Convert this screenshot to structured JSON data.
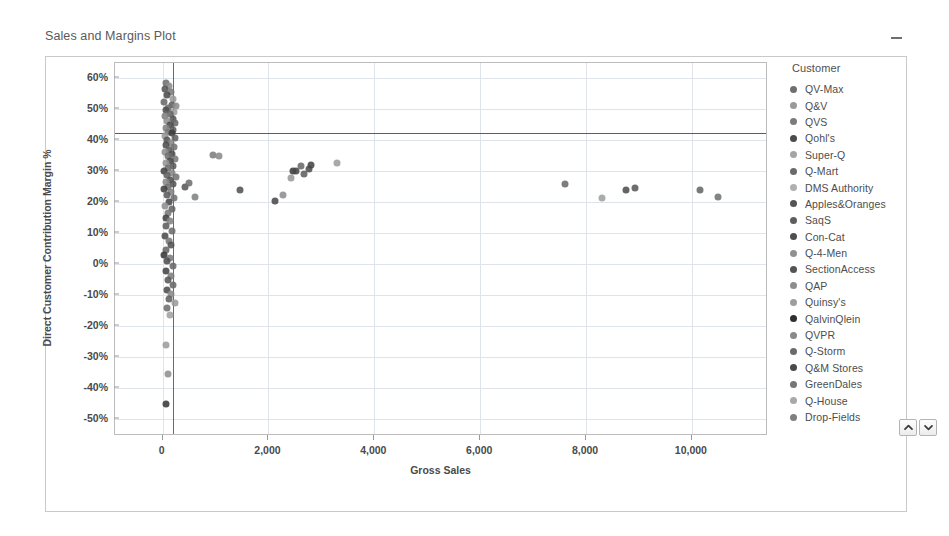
{
  "title": "Sales and Margins Plot",
  "window": {
    "minimize_icon": "minimize-icon"
  },
  "legend": {
    "title": "Customer",
    "scroll_up_icon": "chevron-up-icon",
    "scroll_down_icon": "chevron-down-icon",
    "items": [
      {
        "label": "QV-Max",
        "color": "#6f6f6f"
      },
      {
        "label": "Q&V",
        "color": "#9a9a9a"
      },
      {
        "label": "QVS",
        "color": "#7b7b7b"
      },
      {
        "label": "Qohl's",
        "color": "#4b4b4b"
      },
      {
        "label": "Super-Q",
        "color": "#a5a5a5"
      },
      {
        "label": "Q-Mart",
        "color": "#6a6a6a"
      },
      {
        "label": "DMS Authority",
        "color": "#b0b0b0"
      },
      {
        "label": "Apples&Oranges",
        "color": "#555555"
      },
      {
        "label": "SaqS",
        "color": "#5e5e5e"
      },
      {
        "label": "Con-Cat",
        "color": "#4f4f4f"
      },
      {
        "label": "Q-4-Men",
        "color": "#909090"
      },
      {
        "label": "SectionAccess",
        "color": "#545454"
      },
      {
        "label": "QAP",
        "color": "#8d8d8d"
      },
      {
        "label": "Quinsy's",
        "color": "#9e9e9e"
      },
      {
        "label": "QalvinQlein",
        "color": "#2f2f2f"
      },
      {
        "label": "QVPR",
        "color": "#8a8a8a"
      },
      {
        "label": "Q-Storm",
        "color": "#6b6b6b"
      },
      {
        "label": "Q&M Stores",
        "color": "#4a4a4a"
      },
      {
        "label": "GreenDales",
        "color": "#777777"
      },
      {
        "label": "Q-House",
        "color": "#a8a8a8"
      },
      {
        "label": "Drop-Fields",
        "color": "#7f7f7f"
      }
    ]
  },
  "chart_data": {
    "type": "scatter",
    "title": "Sales and Margins Plot",
    "xlabel": "Gross Sales",
    "ylabel": "Direct Customer Contribution Margin %",
    "xlim": [
      -900,
      11400
    ],
    "ylim": [
      -0.55,
      0.65
    ],
    "xticks": [
      0,
      2000,
      4000,
      6000,
      8000,
      10000
    ],
    "xticklabels": [
      "0",
      "2,000",
      "4,000",
      "6,000",
      "8,000",
      "10,000"
    ],
    "yticks": [
      0.6,
      0.5,
      0.4,
      0.3,
      0.2,
      0.1,
      0.0,
      -0.1,
      -0.2,
      -0.3,
      -0.4,
      -0.5
    ],
    "yticklabels": [
      "60%",
      "50%",
      "40%",
      "30%",
      "20%",
      "10%",
      "0%",
      "-10%",
      "-20%",
      "-30%",
      "-40%",
      "-50%"
    ],
    "grid": true,
    "legend_position": "right",
    "legend_title": "Customer",
    "reference_lines": [
      {
        "orientation": "horizontal",
        "value": 0.425,
        "color": "#5d5d5d"
      },
      {
        "orientation": "vertical",
        "value": 200,
        "color": "#6a6a6a"
      }
    ],
    "points": [
      {
        "x": 60,
        "y": 0.585,
        "color": "#6f6f6f"
      },
      {
        "x": 120,
        "y": 0.575,
        "color": "#8c8c8c"
      },
      {
        "x": 40,
        "y": 0.565,
        "color": "#555555"
      },
      {
        "x": 150,
        "y": 0.555,
        "color": "#7b7b7b"
      },
      {
        "x": 80,
        "y": 0.545,
        "color": "#4b4b4b"
      },
      {
        "x": 200,
        "y": 0.535,
        "color": "#9a9a9a"
      },
      {
        "x": 30,
        "y": 0.525,
        "color": "#6a6a6a"
      },
      {
        "x": 170,
        "y": 0.515,
        "color": "#5e5e5e"
      },
      {
        "x": 250,
        "y": 0.512,
        "color": "#8d8d8d"
      },
      {
        "x": 100,
        "y": 0.505,
        "color": "#707070"
      },
      {
        "x": 60,
        "y": 0.498,
        "color": "#4f4f4f"
      },
      {
        "x": 220,
        "y": 0.492,
        "color": "#a0a0a0"
      },
      {
        "x": 140,
        "y": 0.485,
        "color": "#656565"
      },
      {
        "x": 50,
        "y": 0.478,
        "color": "#7f7f7f"
      },
      {
        "x": 190,
        "y": 0.47,
        "color": "#585858"
      },
      {
        "x": 90,
        "y": 0.462,
        "color": "#909090"
      },
      {
        "x": 240,
        "y": 0.455,
        "color": "#6b6b6b"
      },
      {
        "x": 130,
        "y": 0.448,
        "color": "#4a4a4a"
      },
      {
        "x": 60,
        "y": 0.44,
        "color": "#828282"
      },
      {
        "x": 200,
        "y": 0.433,
        "color": "#5c5c5c"
      },
      {
        "x": 110,
        "y": 0.428,
        "color": "#777777"
      },
      {
        "x": 170,
        "y": 0.422,
        "color": "#3f3f3f"
      },
      {
        "x": 40,
        "y": 0.415,
        "color": "#999999"
      },
      {
        "x": 230,
        "y": 0.408,
        "color": "#626262"
      },
      {
        "x": 90,
        "y": 0.4,
        "color": "#565656"
      },
      {
        "x": 160,
        "y": 0.392,
        "color": "#868686"
      },
      {
        "x": 70,
        "y": 0.385,
        "color": "#4d4d4d"
      },
      {
        "x": 210,
        "y": 0.378,
        "color": "#737373"
      },
      {
        "x": 120,
        "y": 0.37,
        "color": "#5f5f5f"
      },
      {
        "x": 50,
        "y": 0.362,
        "color": "#8f8f8f"
      },
      {
        "x": 180,
        "y": 0.355,
        "color": "#515151"
      },
      {
        "x": 100,
        "y": 0.348,
        "color": "#6e6e6e"
      },
      {
        "x": 240,
        "y": 0.34,
        "color": "#7a7a7a"
      },
      {
        "x": 140,
        "y": 0.333,
        "color": "#474747"
      },
      {
        "x": 60,
        "y": 0.325,
        "color": "#949494"
      },
      {
        "x": 200,
        "y": 0.318,
        "color": "#5a5a5a"
      },
      {
        "x": 110,
        "y": 0.31,
        "color": "#6c6c6c"
      },
      {
        "x": 30,
        "y": 0.302,
        "color": "#444444"
      },
      {
        "x": 170,
        "y": 0.295,
        "color": "#888888"
      },
      {
        "x": 90,
        "y": 0.288,
        "color": "#606060"
      },
      {
        "x": 250,
        "y": 0.28,
        "color": "#757575"
      },
      {
        "x": 130,
        "y": 0.272,
        "color": "#4e4e4e"
      },
      {
        "x": 55,
        "y": 0.265,
        "color": "#8b8b8b"
      },
      {
        "x": 190,
        "y": 0.258,
        "color": "#575757"
      },
      {
        "x": 105,
        "y": 0.25,
        "color": "#6f6f6f"
      },
      {
        "x": 35,
        "y": 0.242,
        "color": "#424242"
      },
      {
        "x": 150,
        "y": 0.232,
        "color": "#818181"
      },
      {
        "x": 80,
        "y": 0.222,
        "color": "#5b5b5b"
      },
      {
        "x": 215,
        "y": 0.212,
        "color": "#717171"
      },
      {
        "x": 120,
        "y": 0.2,
        "color": "#494949"
      },
      {
        "x": 45,
        "y": 0.188,
        "color": "#8e8e8e"
      },
      {
        "x": 175,
        "y": 0.178,
        "color": "#636363"
      },
      {
        "x": 95,
        "y": 0.165,
        "color": "#787878"
      },
      {
        "x": 60,
        "y": 0.15,
        "color": "#404040"
      },
      {
        "x": 140,
        "y": 0.138,
        "color": "#848484"
      },
      {
        "x": 70,
        "y": 0.122,
        "color": "#5d5d5d"
      },
      {
        "x": 180,
        "y": 0.108,
        "color": "#6d6d6d"
      },
      {
        "x": 50,
        "y": 0.092,
        "color": "#4c4c4c"
      },
      {
        "x": 120,
        "y": 0.075,
        "color": "#797979"
      },
      {
        "x": 160,
        "y": 0.06,
        "color": "#535353"
      },
      {
        "x": 70,
        "y": 0.045,
        "color": "#676767"
      },
      {
        "x": 30,
        "y": 0.03,
        "color": "#383838"
      },
      {
        "x": 130,
        "y": 0.02,
        "color": "#7c7c7c"
      },
      {
        "x": 90,
        "y": 0.008,
        "color": "#4f4f4f"
      },
      {
        "x": 190,
        "y": -0.005,
        "color": "#696969"
      },
      {
        "x": 60,
        "y": -0.022,
        "color": "#444444"
      },
      {
        "x": 150,
        "y": -0.038,
        "color": "#7e7e7e"
      },
      {
        "x": 100,
        "y": -0.052,
        "color": "#585858"
      },
      {
        "x": 200,
        "y": -0.068,
        "color": "#6a6a6a"
      },
      {
        "x": 75,
        "y": -0.085,
        "color": "#4b4b4b"
      },
      {
        "x": 165,
        "y": -0.098,
        "color": "#8a8a8a"
      },
      {
        "x": 115,
        "y": -0.112,
        "color": "#616161"
      },
      {
        "x": 230,
        "y": -0.125,
        "color": "#9b9b9b"
      },
      {
        "x": 85,
        "y": -0.142,
        "color": "#707070"
      },
      {
        "x": 130,
        "y": -0.165,
        "color": "#a2a2a2"
      },
      {
        "x": 70,
        "y": -0.262,
        "color": "#9c9c9c"
      },
      {
        "x": 110,
        "y": -0.355,
        "color": "#8f8f8f"
      },
      {
        "x": 60,
        "y": -0.452,
        "color": "#3a3a3a"
      },
      {
        "x": 420,
        "y": 0.248,
        "color": "#595959"
      },
      {
        "x": 500,
        "y": 0.262,
        "color": "#6f6f6f"
      },
      {
        "x": 620,
        "y": 0.215,
        "color": "#828282"
      },
      {
        "x": 960,
        "y": 0.352,
        "color": "#7d7d7d"
      },
      {
        "x": 1060,
        "y": 0.348,
        "color": "#8a8a8a"
      },
      {
        "x": 1460,
        "y": 0.238,
        "color": "#535353"
      },
      {
        "x": 2130,
        "y": 0.205,
        "color": "#4a4a4a"
      },
      {
        "x": 2280,
        "y": 0.222,
        "color": "#8e8e8e"
      },
      {
        "x": 2420,
        "y": 0.278,
        "color": "#9a9a9a"
      },
      {
        "x": 2470,
        "y": 0.3,
        "color": "#3f3f3f"
      },
      {
        "x": 2520,
        "y": 0.302,
        "color": "#484848"
      },
      {
        "x": 2610,
        "y": 0.318,
        "color": "#6a6a6a"
      },
      {
        "x": 2680,
        "y": 0.292,
        "color": "#5e5e5e"
      },
      {
        "x": 2760,
        "y": 0.308,
        "color": "#4d4d4d"
      },
      {
        "x": 2800,
        "y": 0.32,
        "color": "#454545"
      },
      {
        "x": 3300,
        "y": 0.325,
        "color": "#9d9d9d"
      },
      {
        "x": 7600,
        "y": 0.258,
        "color": "#6b6b6b"
      },
      {
        "x": 8300,
        "y": 0.212,
        "color": "#9f9f9f"
      },
      {
        "x": 8750,
        "y": 0.238,
        "color": "#4f4f4f"
      },
      {
        "x": 8920,
        "y": 0.245,
        "color": "#5a5a5a"
      },
      {
        "x": 10150,
        "y": 0.238,
        "color": "#676767"
      },
      {
        "x": 10500,
        "y": 0.218,
        "color": "#737373"
      }
    ]
  }
}
